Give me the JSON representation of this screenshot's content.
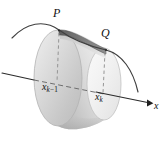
{
  "figure": {
    "canvas": {
      "width": 167,
      "height": 148,
      "background": "#ffffff"
    },
    "labels": {
      "point_p": "P",
      "point_q": "Q",
      "tick_left_base": "x",
      "tick_left_sub_k": "k",
      "tick_left_sub_op": "−",
      "tick_left_sub_one": "1",
      "tick_right_base": "x",
      "tick_right_sub": "k",
      "axis_label": "x"
    },
    "colors": {
      "background": "#ffffff",
      "ink": "#1a1a1a",
      "curve": "#3c3c3c",
      "axis": "#2b2b2b",
      "dashed": "#8c8c8c",
      "band_dark": "#6e6e6e",
      "band_mid": "#9e9e9e",
      "surface_light": "#e6e6e6",
      "surface_mid": "#cfcfcf",
      "surface_shadow": "#b5b5b5",
      "face_left_fill": "#d8d8d8",
      "face_right_fill": "#eeeeee",
      "outline": "#a9a9a9"
    },
    "geometry": {
      "left_face_center_x": 58,
      "left_face_center_y": 78,
      "left_face_rx": 24,
      "left_face_ry": 48,
      "right_face_center_x": 104,
      "right_face_center_y": 84,
      "right_face_rx": 17,
      "right_face_ry": 36,
      "point_p_x": 60,
      "point_p_y": 30,
      "point_q_x": 106,
      "point_q_y": 50,
      "axis_start_x": 2,
      "axis_start_y": 73,
      "axis_end_x": 152,
      "axis_end_y": 104,
      "axis_arrow_x": 150,
      "axis_arrow_y": 103
    },
    "elements": [
      {
        "name": "curve-through-pq",
        "kind": "curve"
      },
      {
        "name": "frustum-lateral-surface",
        "kind": "surface"
      },
      {
        "name": "frustum-left-face",
        "kind": "ellipse"
      },
      {
        "name": "frustum-right-face",
        "kind": "ellipse"
      },
      {
        "name": "frustum-top-band",
        "kind": "band"
      },
      {
        "name": "x-axis",
        "kind": "axis"
      },
      {
        "name": "radius-line-xk-1",
        "kind": "dashed"
      },
      {
        "name": "radius-line-xk",
        "kind": "dashed"
      }
    ]
  }
}
